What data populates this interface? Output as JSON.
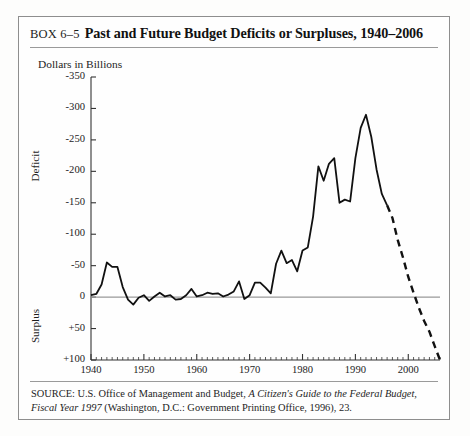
{
  "box": {
    "number": "BOX 6–5",
    "title": "Past and Future Budget Deficits or Surpluses, 1940–2006"
  },
  "source": {
    "label": "SOURCE:",
    "part1": " U.S. Office of Management and Budget, ",
    "italic1": "A Citizen's Guide to the Federal Budget,",
    "italic2": "Fiscal Year 1997",
    "part2": " (Washington, D.C.: Government Printing Office, 1996), 23."
  },
  "chart_data": {
    "type": "line",
    "title": "Past and Future Budget Deficits or Surpluses, 1940–2006",
    "axis_title": "Dollars in Billions",
    "xlabel": "",
    "ylabel": "Dollars in Billions",
    "y_upper_region_label": "Deficit",
    "y_lower_region_label": "Surplus",
    "ylim": [
      -350,
      100
    ],
    "xlim": [
      1940,
      2006
    ],
    "y_ticks": [
      -350,
      -300,
      -250,
      -200,
      -150,
      -100,
      -50,
      0,
      50,
      100
    ],
    "y_tick_labels": [
      "-350",
      "-300",
      "-250",
      "-200",
      "-150",
      "-100",
      "-50",
      "0",
      "+50",
      "+100"
    ],
    "x_ticks": [
      1940,
      1950,
      1960,
      1970,
      1980,
      1990,
      2000
    ],
    "x_tick_labels": [
      "1940",
      "1950",
      "1960",
      "1970",
      "1980",
      "1990",
      "2000"
    ],
    "x_minor_tick_interval": 1,
    "grid": false,
    "legend": "none",
    "zero_line": true,
    "zero_line_color": "#999999",
    "line_color": "#111111",
    "note": "Values are budget deficit (negative, plotted upward) or surplus (positive, plotted downward) in billions of dollars. Solid line = actual through 1996; dashed line = projected 1996–2006.",
    "series": [
      {
        "name": "Actual deficit/surplus",
        "style": "solid",
        "x": [
          1940,
          1941,
          1942,
          1943,
          1944,
          1945,
          1946,
          1947,
          1948,
          1949,
          1950,
          1951,
          1952,
          1953,
          1954,
          1955,
          1956,
          1957,
          1958,
          1959,
          1960,
          1961,
          1962,
          1963,
          1964,
          1965,
          1966,
          1967,
          1968,
          1969,
          1970,
          1971,
          1972,
          1973,
          1974,
          1975,
          1976,
          1977,
          1978,
          1979,
          1980,
          1981,
          1982,
          1983,
          1984,
          1985,
          1986,
          1987,
          1988,
          1989,
          1990,
          1991,
          1992,
          1993,
          1994,
          1995,
          1996
        ],
        "values": [
          -3,
          -5,
          -20,
          -55,
          -48,
          -48,
          -16,
          4,
          12,
          1,
          -3,
          6,
          -1,
          -7,
          -1,
          -3,
          4,
          3,
          -3,
          -13,
          -1,
          -3,
          -7,
          -5,
          -6,
          -1,
          -4,
          -9,
          -25,
          3,
          -3,
          -23,
          -23,
          -15,
          -6,
          -53,
          -74,
          -54,
          -59,
          -41,
          -74,
          -79,
          -128,
          -208,
          -185,
          -212,
          -221,
          -150,
          -155,
          -152,
          -221,
          -269,
          -290,
          -255,
          -203,
          -164,
          -146
        ]
      },
      {
        "name": "Projected deficit/surplus",
        "style": "dashed",
        "x": [
          1996,
          1997,
          1998,
          1999,
          2000,
          2001,
          2002,
          2003,
          2004,
          2005,
          2006
        ],
        "values": [
          -146,
          -126,
          -91,
          -63,
          -32,
          -7,
          17,
          38,
          55,
          78,
          100
        ]
      }
    ]
  }
}
